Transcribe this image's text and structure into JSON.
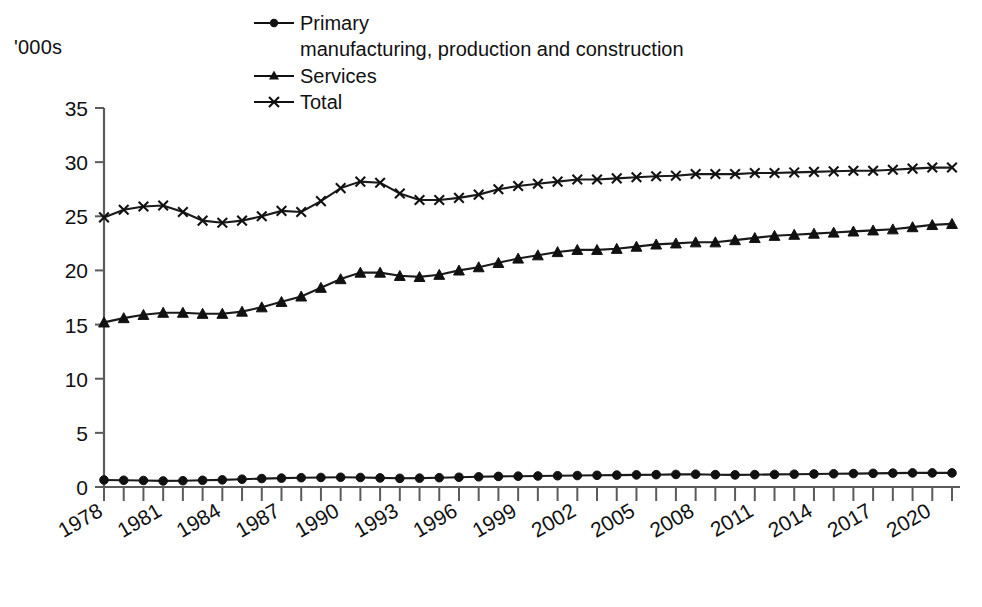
{
  "units_label": "'000s",
  "legend": {
    "items": [
      {
        "label": "Primary",
        "marker": "circle-icon"
      },
      {
        "label": "Services",
        "marker": "triangle-icon"
      },
      {
        "label": "Total",
        "marker": "cross-icon"
      }
    ],
    "sub_label": "manufacturing, production and construction"
  },
  "chart_data": {
    "type": "line",
    "title": "",
    "xlabel": "",
    "ylabel": "'000s",
    "ylim": [
      0,
      35
    ],
    "yticks": [
      0,
      5,
      10,
      15,
      20,
      25,
      30,
      35
    ],
    "grid": false,
    "legend_position": "top",
    "xtick_labels": [
      "1978",
      "1981",
      "1984",
      "1987",
      "1990",
      "1993",
      "1996",
      "1999",
      "2002",
      "2005",
      "2008",
      "2011",
      "2014",
      "2017",
      "2020"
    ],
    "x": [
      1978,
      1979,
      1980,
      1981,
      1982,
      1983,
      1984,
      1985,
      1986,
      1987,
      1988,
      1989,
      1990,
      1991,
      1992,
      1993,
      1994,
      1995,
      1996,
      1997,
      1998,
      1999,
      2000,
      2001,
      2002,
      2003,
      2004,
      2005,
      2006,
      2007,
      2008,
      2009,
      2010,
      2011,
      2012,
      2013,
      2014,
      2015,
      2016,
      2017,
      2018,
      2019,
      2020,
      2021
    ],
    "series": [
      {
        "name": "Primary manufacturing, production and construction",
        "marker": "circle",
        "values": [
          0.65,
          0.62,
          0.6,
          0.56,
          0.58,
          0.62,
          0.66,
          0.72,
          0.78,
          0.82,
          0.86,
          0.88,
          0.9,
          0.88,
          0.84,
          0.8,
          0.82,
          0.86,
          0.9,
          0.94,
          0.98,
          1.0,
          1.02,
          1.04,
          1.06,
          1.08,
          1.1,
          1.12,
          1.14,
          1.16,
          1.18,
          1.14,
          1.12,
          1.14,
          1.16,
          1.18,
          1.2,
          1.22,
          1.24,
          1.26,
          1.28,
          1.3,
          1.3,
          1.3
        ]
      },
      {
        "name": "Services",
        "marker": "triangle",
        "values": [
          15.2,
          15.6,
          15.9,
          16.1,
          16.1,
          16.0,
          16.0,
          16.2,
          16.6,
          17.1,
          17.6,
          18.4,
          19.2,
          19.8,
          19.8,
          19.5,
          19.4,
          19.6,
          20.0,
          20.3,
          20.7,
          21.1,
          21.4,
          21.7,
          21.9,
          21.9,
          22.0,
          22.2,
          22.4,
          22.5,
          22.6,
          22.6,
          22.8,
          23.0,
          23.2,
          23.3,
          23.4,
          23.5,
          23.6,
          23.7,
          23.8,
          24.0,
          24.2,
          24.3
        ]
      },
      {
        "name": "Total",
        "marker": "cross",
        "values": [
          24.9,
          25.6,
          25.9,
          26.0,
          25.4,
          24.6,
          24.4,
          24.6,
          25.0,
          25.5,
          25.4,
          26.4,
          27.6,
          28.2,
          28.1,
          27.1,
          26.5,
          26.5,
          26.7,
          27.0,
          27.5,
          27.8,
          28.0,
          28.2,
          28.4,
          28.4,
          28.5,
          28.6,
          28.7,
          28.75,
          28.9,
          28.9,
          28.9,
          29.0,
          29.0,
          29.05,
          29.1,
          29.15,
          29.2,
          29.2,
          29.3,
          29.4,
          29.5,
          29.5
        ]
      }
    ]
  }
}
